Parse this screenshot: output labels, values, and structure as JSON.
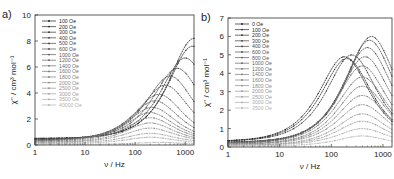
{
  "chart_data": [
    {
      "panel_label": "a)",
      "type": "line",
      "title": "",
      "xlabel": "ν / Hz",
      "ylabel": "χ'' / cm³ mol⁻¹",
      "xscale": "log",
      "xlim": [
        1,
        1500
      ],
      "ylim": [
        0,
        10
      ],
      "xticks": [
        "1",
        "10",
        "100",
        "1000"
      ],
      "yticks": [
        "0",
        "2",
        "4",
        "6",
        "8",
        "10"
      ],
      "grid": false,
      "legend_position": "upper-left",
      "legend": [
        "100 Oe",
        "200 Oe",
        "300 Oe",
        "400 Oe",
        "500 Oe",
        "600 Oe",
        "1000 Oe",
        "1200 Oe",
        "1400 Oe",
        "1600 Oe",
        "1800 Oe",
        "2000 Oe",
        "2500 Oe",
        "3000 Oe",
        "3500 Oe",
        "40000 Oe"
      ],
      "series": [
        {
          "name": "100 Oe",
          "peak_hz": 1500,
          "peak": 8.2,
          "base": 0.5
        },
        {
          "name": "200 Oe",
          "peak_hz": 1400,
          "peak": 7.6,
          "base": 0.5
        },
        {
          "name": "300 Oe",
          "peak_hz": 1000,
          "peak": 6.7,
          "base": 0.45
        },
        {
          "name": "400 Oe",
          "peak_hz": 700,
          "peak": 5.9,
          "base": 0.45
        },
        {
          "name": "500 Oe",
          "peak_hz": 500,
          "peak": 5.3,
          "base": 0.4
        },
        {
          "name": "600 Oe",
          "peak_hz": 400,
          "peak": 4.6,
          "base": 0.4
        },
        {
          "name": "1000 Oe",
          "peak_hz": 300,
          "peak": 3.9,
          "base": 0.35
        },
        {
          "name": "1200 Oe",
          "peak_hz": 250,
          "peak": 3.4,
          "base": 0.35
        },
        {
          "name": "1400 Oe",
          "peak_hz": 220,
          "peak": 2.9,
          "base": 0.3
        },
        {
          "name": "1600 Oe",
          "peak_hz": 200,
          "peak": 2.5,
          "base": 0.3
        },
        {
          "name": "1800 Oe",
          "peak_hz": 200,
          "peak": 2.1,
          "base": 0.25
        },
        {
          "name": "2000 Oe",
          "peak_hz": 200,
          "peak": 1.7,
          "base": 0.2
        },
        {
          "name": "2500 Oe",
          "peak_hz": 200,
          "peak": 1.3,
          "base": 0.2
        },
        {
          "name": "3000 Oe",
          "peak_hz": 200,
          "peak": 0.9,
          "base": 0.15
        },
        {
          "name": "3500 Oe",
          "peak_hz": 200,
          "peak": 0.6,
          "base": 0.1
        },
        {
          "name": "40000 Oe",
          "peak_hz": 300,
          "peak": 0.2,
          "base": 0.05
        }
      ]
    },
    {
      "panel_label": "b)",
      "type": "line",
      "title": "",
      "xlabel": "ν / Hz",
      "ylabel": "χ'' / cm³ mol⁻¹",
      "xscale": "log",
      "xlim": [
        1,
        1500
      ],
      "ylim": [
        0,
        7
      ],
      "xticks": [
        "1",
        "10",
        "100",
        "1000"
      ],
      "yticks": [
        "0",
        "1",
        "2",
        "3",
        "4",
        "5",
        "6",
        "7"
      ],
      "grid": false,
      "legend_position": "upper-left",
      "legend": [
        "0 Oe",
        "100 Oe",
        "200 Oe",
        "300 Oe",
        "400 Oe",
        "600 Oe",
        "800 Oe",
        "1000 Oe",
        "1200 Oe",
        "1400 Oe",
        "1600 Oe",
        "1800 Oe",
        "2000 Oe",
        "2500 Oe",
        "3000 Oe",
        "3500 Oe"
      ],
      "series": [
        {
          "name": "0 Oe",
          "peak_hz": 180,
          "peak": 4.9,
          "base": 0.3
        },
        {
          "name": "100 Oe",
          "peak_hz": 200,
          "peak": 4.8,
          "base": 0.3
        },
        {
          "name": "200 Oe",
          "peak_hz": 250,
          "peak": 5.0,
          "base": 0.3
        },
        {
          "name": "300 Oe",
          "peak_hz": 600,
          "peak": 6.0,
          "base": 0.25
        },
        {
          "name": "400 Oe",
          "peak_hz": 550,
          "peak": 5.8,
          "base": 0.25
        },
        {
          "name": "600 Oe",
          "peak_hz": 500,
          "peak": 5.4,
          "base": 0.25
        },
        {
          "name": "800 Oe",
          "peak_hz": 450,
          "peak": 4.9,
          "base": 0.2
        },
        {
          "name": "1000 Oe",
          "peak_hz": 400,
          "peak": 4.4,
          "base": 0.2
        },
        {
          "name": "1200 Oe",
          "peak_hz": 400,
          "peak": 3.8,
          "base": 0.2
        },
        {
          "name": "1400 Oe",
          "peak_hz": 400,
          "peak": 3.3,
          "base": 0.15
        },
        {
          "name": "1600 Oe",
          "peak_hz": 400,
          "peak": 2.8,
          "base": 0.15
        },
        {
          "name": "1800 Oe",
          "peak_hz": 400,
          "peak": 2.3,
          "base": 0.15
        },
        {
          "name": "2000 Oe",
          "peak_hz": 400,
          "peak": 1.8,
          "base": 0.1
        },
        {
          "name": "2500 Oe",
          "peak_hz": 400,
          "peak": 1.4,
          "base": 0.1
        },
        {
          "name": "3000 Oe",
          "peak_hz": 400,
          "peak": 1.0,
          "base": 0.1
        },
        {
          "name": "3500 Oe",
          "peak_hz": 400,
          "peak": 0.6,
          "base": 0.05
        }
      ]
    }
  ]
}
